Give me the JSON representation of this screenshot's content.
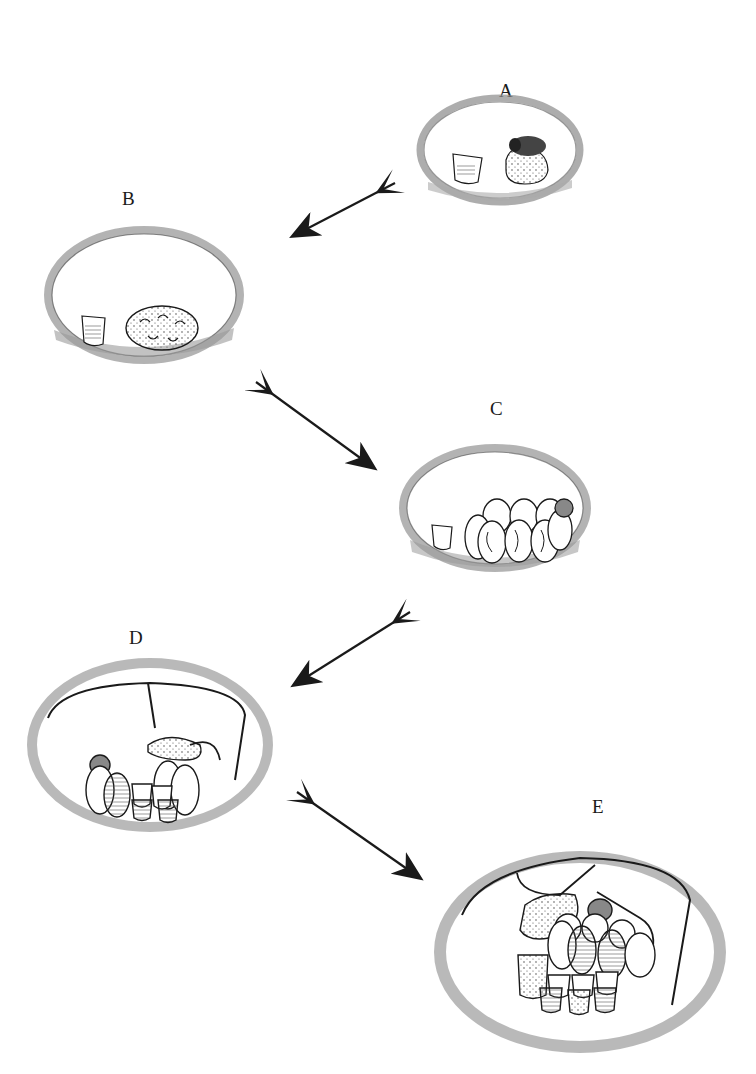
{
  "figure": {
    "stages": [
      {
        "id": "A",
        "label": "A",
        "content": "Queen incubating initial pollen lump beside a honey pot"
      },
      {
        "id": "B",
        "label": "B",
        "content": "Honey pot and wax-covered pollen lump with first brood larvae"
      },
      {
        "id": "C",
        "label": "C",
        "content": "Honey pot and row of cocoons with developing pupae"
      },
      {
        "id": "D",
        "label": "D",
        "content": "Wax canopy formed; brood clump, cocoons and several honey pots"
      },
      {
        "id": "E",
        "label": "E",
        "content": "Enlarged nest with wax canopy, brood clumps, cocoons and many storage pots"
      }
    ],
    "arrows": [
      {
        "from": "A",
        "to": "B"
      },
      {
        "from": "B",
        "to": "C"
      },
      {
        "from": "C",
        "to": "D"
      },
      {
        "from": "D",
        "to": "E"
      }
    ],
    "colors": {
      "ink": "#1a1a1a",
      "nest_material": "#8a8a8a",
      "background": "#ffffff"
    }
  }
}
